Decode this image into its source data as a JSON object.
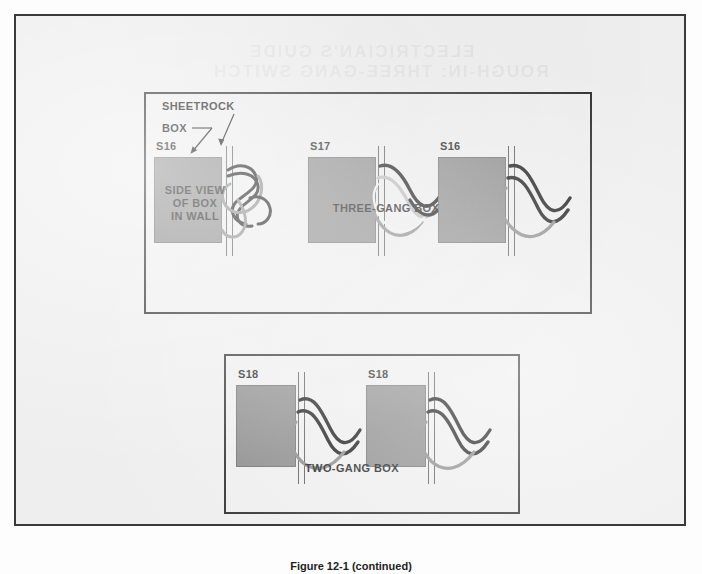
{
  "figure": {
    "caption": "Figure 12-1 (continued)"
  },
  "bleed_through": {
    "line1": "ELECTRICIAN'S GUIDE",
    "line2": "ROUGH-IN: THREE-GANG SWITCH"
  },
  "callouts": [
    {
      "id": "sheetrock",
      "label": "SHEETROCK"
    },
    {
      "id": "box",
      "label": "BOX"
    }
  ],
  "panels": [
    {
      "id": "three-gang",
      "caption": "THREE-GANG BOX",
      "side_caption": "SIDE VIEW\nOF BOX\nIN WALL",
      "assemblies": [
        {
          "tag": "S16",
          "wire_style": "tangled"
        },
        {
          "tag": "S17",
          "wire_style": "wavy"
        },
        {
          "tag": "S16",
          "wire_style": "wavy"
        }
      ]
    },
    {
      "id": "two-gang",
      "caption": "TWO-GANG BOX",
      "assemblies": [
        {
          "tag": "S18",
          "wire_style": "wavy"
        },
        {
          "tag": "S18",
          "wire_style": "wavy"
        }
      ]
    }
  ],
  "colors": {
    "page_background": "#eeeeee",
    "page_border": "#3a3a3a",
    "panel_border": "#2e2e2e",
    "box_fill": "#8b8b8b",
    "box_stroke": "#6f6f6f",
    "wall_line": "#5a5a5a",
    "wire_black": "#1a1a1a",
    "wire_gray": "#8a8a8a",
    "wire_white": "#f2f2f2",
    "text": "#1b1b1b"
  }
}
